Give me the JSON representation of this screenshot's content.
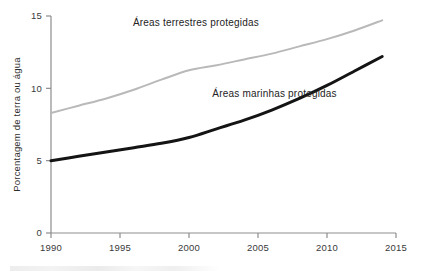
{
  "chart_data": {
    "type": "line",
    "title": "",
    "xlabel": "",
    "ylabel": "Porcentagem de terra ou água",
    "xlim": [
      1990,
      2015
    ],
    "ylim": [
      0,
      15
    ],
    "grid": false,
    "legend_position": "inline-annotations",
    "x_ticks": [
      "1990",
      "1995",
      "2000",
      "2005",
      "2010",
      "2015"
    ],
    "x_tick_values": [
      1990,
      1995,
      2000,
      2005,
      2010,
      2015
    ],
    "y_ticks": [
      "0",
      "5",
      "10",
      "15"
    ],
    "y_tick_values": [
      0,
      5,
      10,
      15
    ],
    "series": [
      {
        "name": "Áreas terrestres protegidas",
        "color": "#b9b9b9",
        "width": 2.0,
        "label_x": 2000.5,
        "label_y": 14.3,
        "x": [
          1990,
          1992,
          1994,
          1996,
          1998,
          2000,
          2002,
          2004,
          2006,
          2008,
          2010,
          2012,
          2014
        ],
        "values": [
          8.3,
          8.8,
          9.3,
          9.9,
          10.6,
          11.25,
          11.6,
          12.0,
          12.4,
          12.9,
          13.4,
          14.0,
          14.7
        ]
      },
      {
        "name": "Áreas marinhas protegidas",
        "color": "#141414",
        "width": 3.0,
        "label_x": 2006.2,
        "label_y": 9.4,
        "x": [
          1990,
          1992,
          1994,
          1996,
          1998,
          2000,
          2002,
          2004,
          2006,
          2008,
          2010,
          2012,
          2014
        ],
        "values": [
          5.0,
          5.3,
          5.6,
          5.9,
          6.2,
          6.6,
          7.2,
          7.8,
          8.5,
          9.3,
          10.2,
          11.2,
          12.2
        ]
      }
    ]
  },
  "axes": {
    "y_axis_title": "Porcentagem de terra ou água",
    "y_tick_labels": [
      "15",
      "10",
      "5",
      "0"
    ],
    "x_tick_labels": [
      "1990",
      "1995",
      "2000",
      "2005",
      "2010",
      "2015"
    ]
  },
  "annotations": {
    "terrestrial_label": "Áreas terrestres protegidas",
    "marine_label": "Áreas marinhas protegidas"
  },
  "colors": {
    "terrestrial_line": "#b9b9b9",
    "marine_line": "#141414",
    "axis": "#8d8d8d",
    "text": "#2e2e2e",
    "background": "#ffffff"
  }
}
